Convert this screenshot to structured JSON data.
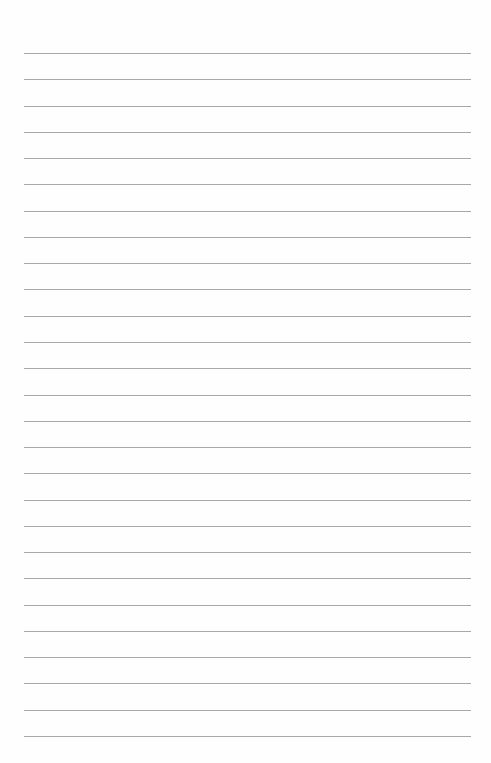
{
  "page": {
    "type": "lined-paper",
    "background_color": "#fefefe",
    "line_color": "#a8a8a8",
    "line_count": 27,
    "first_line_y": 53,
    "line_spacing": 26.27,
    "line_left": 24,
    "line_width": 447,
    "lines": []
  }
}
